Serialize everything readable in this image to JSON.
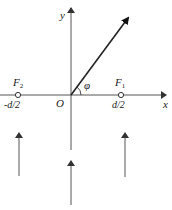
{
  "diagram": {
    "type": "coordinate-geometry",
    "colors": {
      "line": "#555555",
      "ray": "#222222",
      "text": "#222222",
      "background": "#ffffff"
    },
    "axes": {
      "x_label": "x",
      "y_label": "y",
      "origin_label": "O"
    },
    "points": [
      {
        "name": "F2",
        "symbol": "F",
        "subscript": "2",
        "position_label": "-d/2"
      },
      {
        "name": "F1",
        "symbol": "F",
        "subscript": "1",
        "position_label": "d/2"
      }
    ],
    "ray": {
      "angle_label": "φ",
      "description": "ray from origin at angle φ to x-axis"
    },
    "incoming_arrows": [
      {
        "position": "left",
        "direction": "up"
      },
      {
        "position": "center",
        "direction": "up"
      },
      {
        "position": "right",
        "direction": "up"
      }
    ]
  }
}
